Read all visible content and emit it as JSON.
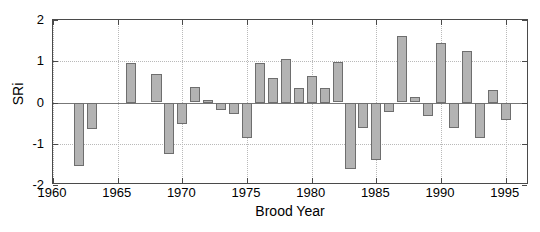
{
  "chart_data": {
    "type": "bar",
    "title": "",
    "xlabel": "Brood Year",
    "ylabel": "SRi",
    "xlim": [
      1960,
      1996.8
    ],
    "ylim": [
      -2,
      2
    ],
    "xticks": [
      1960,
      1965,
      1970,
      1975,
      1980,
      1985,
      1990,
      1995
    ],
    "xticklabels": [
      "1960",
      "1965",
      "1970",
      "1975",
      "1980",
      "1985",
      "1990",
      "1995"
    ],
    "yticks": [
      -2,
      -1,
      0,
      1,
      2
    ],
    "yticklabels": [
      "-2",
      "-1",
      "0",
      "1",
      "2"
    ],
    "grid": "dotted",
    "legend": "none",
    "bar_color": "#b3b3b3",
    "bar_edge_color": "#6e6e6e",
    "axis_color": "#4a4a4a",
    "categories": [
      1962,
      1963,
      1966,
      1968,
      1969,
      1970,
      1971,
      1972,
      1973,
      1974,
      1975,
      1976,
      1977,
      1978,
      1979,
      1980,
      1981,
      1982,
      1983,
      1984,
      1985,
      1986,
      1987,
      1988,
      1989,
      1990,
      1991,
      1992,
      1993,
      1994,
      1995
    ],
    "values": [
      -1.55,
      -0.65,
      0.95,
      0.68,
      -1.25,
      -0.52,
      0.37,
      0.05,
      -0.18,
      -0.28,
      -0.85,
      0.95,
      0.6,
      1.05,
      0.35,
      0.65,
      0.35,
      0.98,
      -1.6,
      -0.62,
      -1.4,
      -0.22,
      1.62,
      0.14,
      -0.32,
      1.45,
      -0.62,
      1.25,
      -0.85,
      0.3,
      -0.42
    ]
  }
}
